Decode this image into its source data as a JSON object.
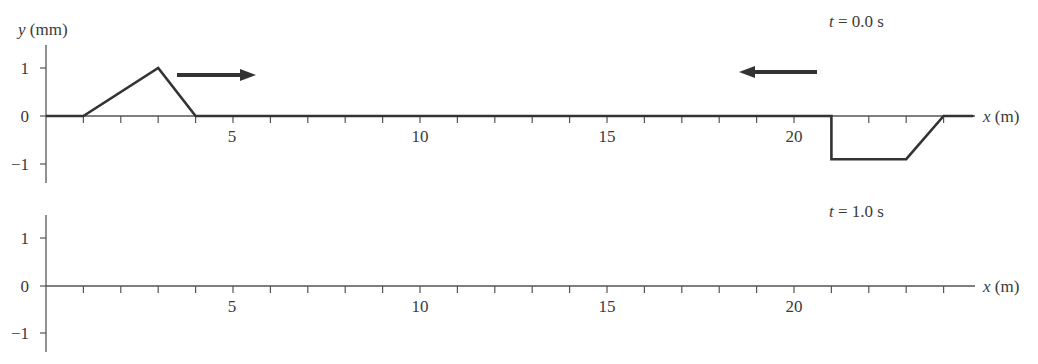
{
  "chart_data": [
    {
      "type": "line",
      "title": "t = 0.0 s",
      "time_label": {
        "var": "t",
        "rest": " = 0.0 s"
      },
      "xlabel": "x (m)",
      "ylabel": "y (mm)",
      "xlim": [
        0,
        25
      ],
      "ylim": [
        -1.4,
        1.5
      ],
      "x_tick_labels": [
        "5",
        "10",
        "15",
        "20"
      ],
      "x_tick_labeled_values": [
        5,
        10,
        15,
        20
      ],
      "x_minor_ticks": [
        1,
        2,
        3,
        4,
        5,
        6,
        7,
        8,
        9,
        10,
        11,
        12,
        13,
        14,
        15,
        16,
        17,
        18,
        19,
        20,
        21,
        22,
        23,
        24
      ],
      "y_tick_labels": [
        "1",
        "0",
        "−1"
      ],
      "y_tick_values": [
        1,
        0,
        -1
      ],
      "grid": false,
      "series": [
        {
          "name": "wave at t=0.0 s",
          "x": [
            0,
            1,
            3,
            4,
            21,
            21,
            23,
            24,
            24.8
          ],
          "y": [
            0,
            0,
            1,
            0,
            0,
            -0.9,
            -0.9,
            0,
            0
          ]
        }
      ],
      "annotations": [
        {
          "type": "arrow",
          "direction": "right",
          "label": "right-moving pulse direction",
          "x_start": 3.5,
          "x_end": 5.6,
          "y": 0.85
        },
        {
          "type": "arrow",
          "direction": "left",
          "label": "left-moving pulse direction",
          "x_start": 20.6,
          "x_end": 18.5,
          "y": 0.9
        }
      ]
    },
    {
      "type": "line",
      "title": "t = 1.0 s",
      "time_label": {
        "var": "t",
        "rest": " = 1.0 s"
      },
      "xlabel": "x (m)",
      "ylabel": "",
      "xlim": [
        0,
        25
      ],
      "ylim": [
        -1.4,
        1.5
      ],
      "x_tick_labels": [
        "5",
        "10",
        "15",
        "20"
      ],
      "x_tick_labeled_values": [
        5,
        10,
        15,
        20
      ],
      "x_minor_ticks": [
        1,
        2,
        3,
        4,
        5,
        6,
        7,
        8,
        9,
        10,
        11,
        12,
        13,
        14,
        15,
        16,
        17,
        18,
        19,
        20,
        21,
        22,
        23,
        24
      ],
      "y_tick_labels": [
        "1",
        "0",
        "−1"
      ],
      "y_tick_values": [
        1,
        0,
        -1
      ],
      "grid": false,
      "series": []
    }
  ],
  "labels": {
    "ylabel_var": "y",
    "ylabel_unit": " (mm)",
    "xlabel_var": "x",
    "xlabel_unit": " (m)",
    "top_time_var": "t",
    "top_time_rest": " = 0.0 s",
    "bottom_time_var": "t",
    "bottom_time_rest": " = 1.0 s",
    "y_ticks": [
      "1",
      "0",
      "−1"
    ],
    "x_ticks": [
      "5",
      "10",
      "15",
      "20"
    ]
  },
  "colors": {
    "ink": "#333333",
    "axis": "#555555",
    "text": "#3a3a3a"
  }
}
